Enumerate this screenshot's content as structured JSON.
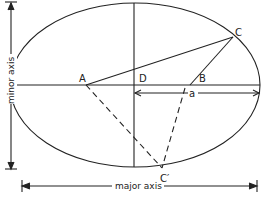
{
  "points": {
    "A": "A",
    "B": "B",
    "C": "C",
    "C_prime": "C′",
    "D": "D",
    "a": "a"
  },
  "axes": {
    "major": "major axis",
    "minor": "minor axis"
  },
  "colors": {
    "stroke": "#222222",
    "background": "#ffffff"
  }
}
